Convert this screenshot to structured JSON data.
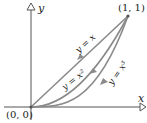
{
  "diagram": {
    "axes": {
      "x_label": "x",
      "y_label": "y"
    },
    "points": {
      "origin": "(0, 0)",
      "end": "(1, 1)"
    },
    "curves": [
      {
        "label": "y = x",
        "equation": "y = x"
      },
      {
        "label": "y = x²",
        "equation": "y = x^2"
      },
      {
        "label": "y = x³",
        "equation": "y = x^3"
      }
    ],
    "colors": {
      "curve": "#8a8a8a",
      "axis": "#555555",
      "text": "#222222"
    }
  }
}
